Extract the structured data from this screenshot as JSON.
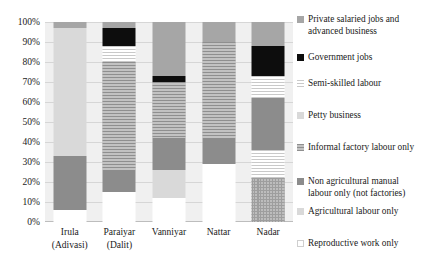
{
  "chart_data": {
    "type": "bar",
    "subtype": "stacked-percentage-column",
    "title": "",
    "xlabel": "",
    "ylabel": "",
    "ylim": [
      0,
      100
    ],
    "ytick_labels": [
      "100%",
      "90%",
      "80%",
      "70%",
      "60%",
      "50%",
      "40%",
      "30%",
      "20%",
      "10%",
      "0%"
    ],
    "ytick_values": [
      100,
      90,
      80,
      70,
      60,
      50,
      40,
      30,
      20,
      10,
      0
    ],
    "grid": true,
    "legend_position": "right",
    "categories": [
      {
        "id": "irula",
        "line1": "Irula",
        "line2": "(Adivasi)"
      },
      {
        "id": "paraiyar",
        "line1": "Paraiyar",
        "line2": "(Dalit)"
      },
      {
        "id": "vanniyar",
        "line1": "Vanniyar",
        "line2": ""
      },
      {
        "id": "nattar",
        "line1": "Nattar",
        "line2": ""
      },
      {
        "id": "nadar",
        "line1": "Nadar",
        "line2": ""
      }
    ],
    "series": [
      {
        "name": "Private salaried jobs and advanced business",
        "fill": "medgray",
        "color": "#a6a6a6",
        "values": [
          3,
          3,
          27,
          10,
          12
        ]
      },
      {
        "name": "Government jobs",
        "fill": "black",
        "color": "#0d0d0d",
        "values": [
          0,
          9,
          3,
          0,
          15
        ]
      },
      {
        "name": "Semi-skilled labour",
        "fill": "lighthatch",
        "color": "#c9c9c9",
        "values": [
          0,
          8,
          0,
          0,
          11
        ]
      },
      {
        "name": "Petty business",
        "fill": "lightgray",
        "color": "#d9d9d9",
        "values": [
          64,
          0,
          0,
          0,
          0
        ]
      },
      {
        "name": "Informal factory labour only",
        "fill": "medhatch",
        "color": "#b5b5b5",
        "values": [
          0,
          54,
          28,
          48,
          0
        ]
      },
      {
        "name": "Non agricultural manual labour only (not factories)",
        "fill": "darkgray",
        "color": "#8c8c8c",
        "values": [
          27,
          11,
          16,
          13,
          26
        ]
      },
      {
        "name": "Agricultural labour only",
        "fill": "lightgray2",
        "color": "#d9d9d9",
        "values": [
          0,
          0,
          14,
          0,
          14
        ]
      },
      {
        "name": "Reproductive work only",
        "fill": "white",
        "color": "#ffffff",
        "values": [
          6,
          15,
          12,
          29,
          22
        ]
      }
    ],
    "stacks": [
      {
        "category": "irula",
        "segments": [
          {
            "series": "Private salaried jobs and advanced business",
            "fill": "medgray",
            "from": 97,
            "to": 100
          },
          {
            "series": "Petty business",
            "fill": "lightgray",
            "from": 33,
            "to": 97
          },
          {
            "series": "Non agricultural manual labour only (not factories)",
            "fill": "darkgray",
            "from": 6,
            "to": 33
          },
          {
            "series": "Reproductive work only",
            "fill": "white",
            "from": 0,
            "to": 6
          }
        ]
      },
      {
        "category": "paraiyar",
        "segments": [
          {
            "series": "Private salaried jobs and advanced business",
            "fill": "medgray",
            "from": 97,
            "to": 100
          },
          {
            "series": "Government jobs",
            "fill": "black",
            "from": 88,
            "to": 97
          },
          {
            "series": "Semi-skilled labour",
            "fill": "lighthatch",
            "from": 80,
            "to": 88
          },
          {
            "series": "Informal factory labour only",
            "fill": "medhatch",
            "from": 26,
            "to": 80
          },
          {
            "series": "Non agricultural manual labour only (not factories)",
            "fill": "darkgray",
            "from": 15,
            "to": 26
          },
          {
            "series": "Reproductive work only",
            "fill": "white",
            "from": 0,
            "to": 15
          }
        ]
      },
      {
        "category": "vanniyar",
        "segments": [
          {
            "series": "Private salaried jobs and advanced business",
            "fill": "medgray",
            "from": 73,
            "to": 100
          },
          {
            "series": "Government jobs",
            "fill": "black",
            "from": 70,
            "to": 73
          },
          {
            "series": "Informal factory labour only",
            "fill": "medhatch",
            "from": 42,
            "to": 70
          },
          {
            "series": "Non agricultural manual labour only (not factories)",
            "fill": "darkgray",
            "from": 26,
            "to": 42
          },
          {
            "series": "Agricultural labour only",
            "fill": "lightgray",
            "from": 12,
            "to": 26
          },
          {
            "series": "Reproductive work only",
            "fill": "white",
            "from": 0,
            "to": 12
          }
        ]
      },
      {
        "category": "nattar",
        "segments": [
          {
            "series": "Private salaried jobs and advanced business",
            "fill": "medgray",
            "from": 90,
            "to": 100
          },
          {
            "series": "Informal factory labour only",
            "fill": "medhatch",
            "from": 42,
            "to": 90
          },
          {
            "series": "Non agricultural manual labour only (not factories)",
            "fill": "darkgray",
            "from": 29,
            "to": 42
          },
          {
            "series": "Reproductive work only",
            "fill": "white",
            "from": 0,
            "to": 29
          }
        ]
      },
      {
        "category": "nadar",
        "segments": [
          {
            "series": "Private salaried jobs and advanced business",
            "fill": "medgray",
            "from": 88,
            "to": 100
          },
          {
            "series": "Government jobs",
            "fill": "black",
            "from": 73,
            "to": 88
          },
          {
            "series": "Semi-skilled labour",
            "fill": "lighthatch",
            "from": 62,
            "to": 73
          },
          {
            "series": "Non agricultural manual labour only (not factories)",
            "fill": "darkgray",
            "from": 36,
            "to": 62
          },
          {
            "series": "Agricultural labour only",
            "fill": "lighthatch",
            "from": 22,
            "to": 36
          },
          {
            "series": "Reproductive work only",
            "fill": "dots",
            "from": 0,
            "to": 22
          }
        ]
      }
    ]
  },
  "legend": {
    "items": [
      {
        "label": "Private salaried jobs and\nadvanced business",
        "fill": "medgray",
        "color": "#a6a6a6"
      },
      {
        "label": "Government jobs",
        "fill": "black",
        "color": "#0d0d0d"
      },
      {
        "label": "Semi-skilled labour",
        "fill": "lighthatch",
        "color": "#c9c9c9"
      },
      {
        "label": "Petty business",
        "fill": "lightgray",
        "color": "#d9d9d9"
      },
      {
        "label": "Informal factory labour only",
        "fill": "medhatch",
        "color": "#b5b5b5"
      },
      {
        "label": "Non agricultural manual\nlabour only (not factories)",
        "fill": "darkgray",
        "color": "#8c8c8c"
      },
      {
        "label": "Agricultural labour only",
        "fill": "lightgray",
        "color": "#d9d9d9"
      },
      {
        "label": "Reproductive work only",
        "fill": "white",
        "color": "#ffffff"
      }
    ]
  },
  "colors": {
    "plot_background": "#f0f0f0",
    "gridline": "#d6d6d6",
    "text": "#1a1a1a"
  }
}
